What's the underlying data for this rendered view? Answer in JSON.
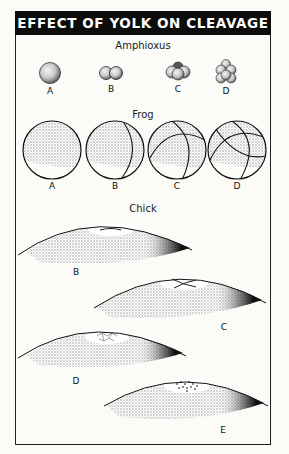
{
  "title": "EFFECT OF YOLK ON CLEAVAGE",
  "sections": {
    "amphioxus": {
      "title": "Amphioxus",
      "stages": [
        {
          "label": "A",
          "description": "uncleaved egg"
        },
        {
          "label": "B",
          "description": "2-cell stage"
        },
        {
          "label": "C",
          "description": "4-cell stage"
        },
        {
          "label": "D",
          "description": "8-cell stage"
        }
      ]
    },
    "frog": {
      "title": "Frog",
      "stages": [
        {
          "label": "A",
          "description": "uncleaved egg with yolk"
        },
        {
          "label": "B",
          "description": "first cleavage furrow"
        },
        {
          "label": "C",
          "description": "second cleavage furrow"
        },
        {
          "label": "D",
          "description": "third (latitudinal) cleavage"
        }
      ]
    },
    "chick": {
      "title": "Chick",
      "stages": [
        {
          "label": "B",
          "description": "first cleavage furrow in blastodisc"
        },
        {
          "label": "C",
          "description": "second cleavage, cross furrows"
        },
        {
          "label": "D",
          "description": "further cleavage of blastodisc"
        },
        {
          "label": "E",
          "description": "multicellular blastodisc"
        }
      ]
    }
  },
  "colors": {
    "header_bg": "#0c0c0c",
    "header_text": "#ffffff",
    "line": "#1a1a1a",
    "yolk_stipple": "#9a9a9a"
  }
}
